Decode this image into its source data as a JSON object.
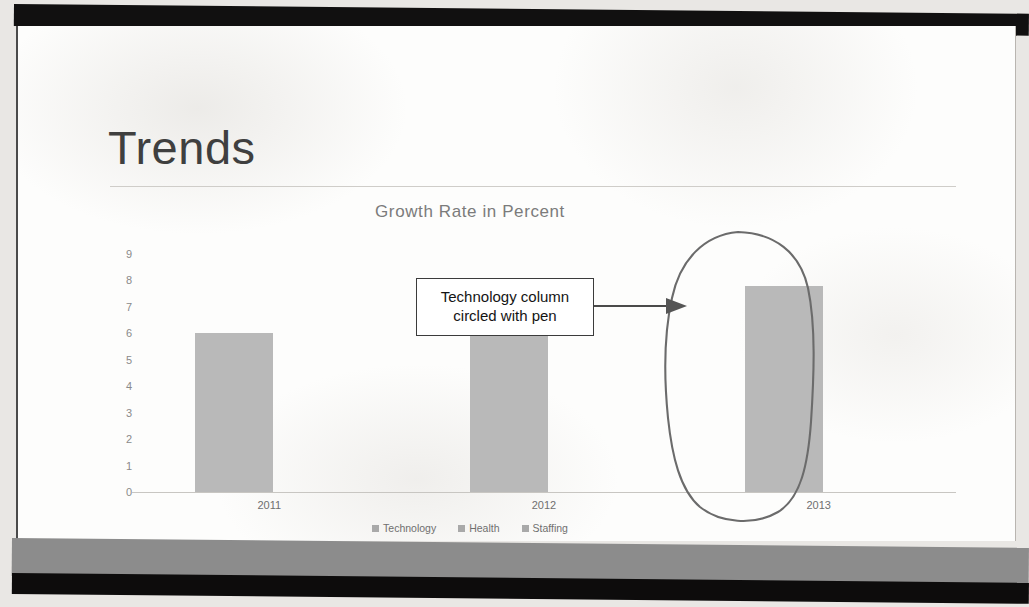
{
  "slide": {
    "title": "Trends"
  },
  "annotation": {
    "callout_line1": "Technology column",
    "callout_line2": "circled with pen",
    "arrow_name": "arrow-right",
    "pen_mark_name": "hand-drawn-ellipse"
  },
  "chart_data": {
    "type": "bar",
    "title": "Growth Rate in Percent",
    "categories": [
      "2011",
      "2012",
      "2013"
    ],
    "series": [
      {
        "name": "Technology",
        "values": [
          6,
          7.4,
          7.8
        ]
      },
      {
        "name": "Health",
        "values": [
          null,
          null,
          null
        ]
      },
      {
        "name": "Staffing",
        "values": [
          null,
          null,
          null
        ]
      }
    ],
    "values": [
      6,
      7.4,
      7.8
    ],
    "yticks": [
      "9",
      "8",
      "7",
      "6",
      "5",
      "4",
      "3",
      "2",
      "1",
      "0"
    ],
    "ylim": [
      0,
      9
    ],
    "xlabel": "",
    "ylabel": "",
    "grid": false,
    "legend": [
      "Technology",
      "Health",
      "Staffing"
    ],
    "legend_position": "bottom",
    "bar_color": "#b9b9b9",
    "axis_color": "#c8c6c2"
  }
}
